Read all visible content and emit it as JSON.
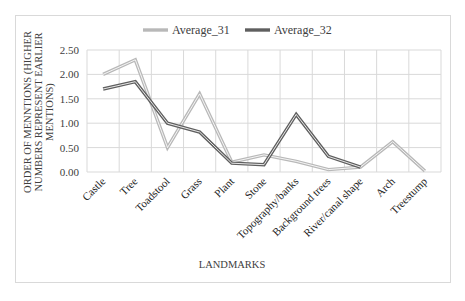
{
  "chart_data": {
    "type": "line",
    "title": "",
    "xlabel": "LANDMARKS",
    "ylabel": "ORDER OF MENNTIONS (HIGHER NUMBERS REPRESENT EARLIER MENTIONS)",
    "ylabel_lines": [
      "ORDER OF MENNTIONS (HIGHER",
      "NUMBERS REPRESENT EARLIER",
      "MENTIONS)"
    ],
    "ylim": [
      0,
      2.5
    ],
    "yticks": [
      "0.00",
      "0.50",
      "1.00",
      "1.50",
      "2.00",
      "2.50"
    ],
    "grid": true,
    "legend_position": "top",
    "categories": [
      "Castle",
      "Tree",
      "Toadstool",
      "Grass",
      "Plant",
      "Stone",
      "Topography/banks",
      "Background trees",
      "River/canal shape",
      "Arch",
      "Treestump"
    ],
    "series": [
      {
        "name": "Average_31",
        "color": "#b8b8b8",
        "values": [
          2.0,
          2.3,
          0.5,
          1.6,
          0.2,
          0.35,
          0.22,
          0.05,
          0.1,
          0.62,
          0.02
        ]
      },
      {
        "name": "Average_32",
        "color": "#5f5f5f",
        "values": [
          1.7,
          1.85,
          1.0,
          0.82,
          0.18,
          0.15,
          1.18,
          0.32,
          0.1,
          null,
          null
        ]
      }
    ]
  }
}
